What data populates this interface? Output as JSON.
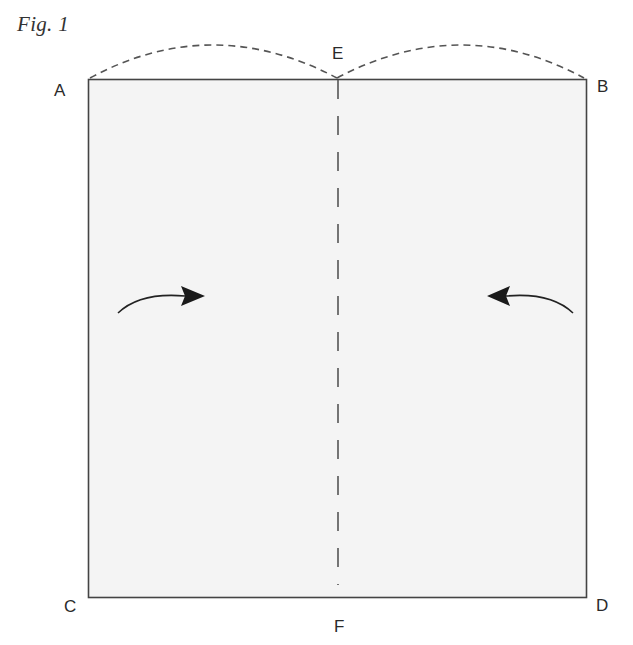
{
  "figure": {
    "title": "Fig. 1"
  },
  "points": {
    "A": "A",
    "B": "B",
    "C": "C",
    "D": "D",
    "E": "E",
    "F": "F"
  },
  "colors": {
    "paper_fill": "#f4f4f4",
    "stroke": "#444444",
    "dashed": "#555555",
    "arrow": "#1a1a1a"
  },
  "diagram": {
    "type": "folding-instruction",
    "rectangle": {
      "corners": [
        "A",
        "B",
        "C",
        "D"
      ]
    },
    "fold_line": {
      "from": "E",
      "to": "F",
      "style": "dashed",
      "orientation": "vertical-center"
    },
    "arcs": [
      {
        "from": "A",
        "to": "E",
        "style": "dashed"
      },
      {
        "from": "E",
        "to": "B",
        "style": "dashed"
      }
    ],
    "arrows": [
      {
        "side": "left",
        "direction": "right",
        "meaning": "fold left half toward center"
      },
      {
        "side": "right",
        "direction": "left",
        "meaning": "fold right half toward center"
      }
    ]
  }
}
